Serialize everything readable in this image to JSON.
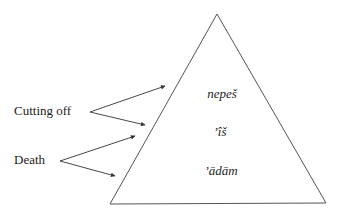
{
  "diagram": {
    "labels": {
      "cutting_off": "Cutting off",
      "death": "Death"
    },
    "triangle_terms": {
      "top": "nepeš",
      "middle": "’îš",
      "bottom": "’ādām"
    },
    "colors": {
      "line": "#555555",
      "text": "#222222"
    }
  }
}
